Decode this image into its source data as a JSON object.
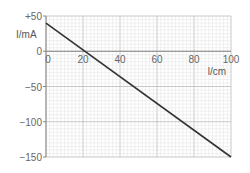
{
  "chart_data": {
    "type": "line",
    "title": "",
    "xlabel": "l/cm",
    "ylabel": "I/mA",
    "xlim": [
      0,
      100
    ],
    "ylim": [
      -150,
      50
    ],
    "x_ticks": [
      "0",
      "20",
      "40",
      "60",
      "80",
      "100"
    ],
    "y_ticks": [
      "+50",
      "0",
      "-50",
      "-100",
      "-150"
    ],
    "grid": true,
    "legend": null,
    "series": [
      {
        "name": "I vs l",
        "x": [
          0,
          100
        ],
        "y": [
          40,
          -150
        ]
      }
    ],
    "line_color": "#333333",
    "grid_color": "#cccccc"
  }
}
